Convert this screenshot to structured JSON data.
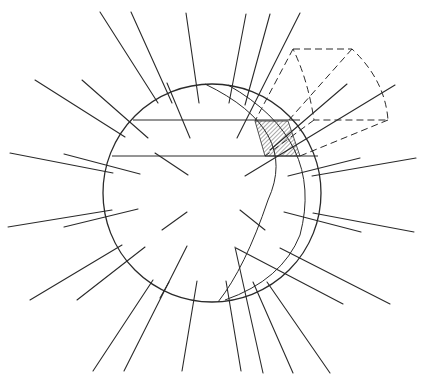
{
  "diagram": {
    "colors": {
      "stroke": "#2a2a2a",
      "background": "#ffffff",
      "hatch": "#555555"
    },
    "sphere": {
      "cx": 212,
      "cy": 193,
      "r": 109
    },
    "chords": [
      {
        "x1": 133,
        "y1": 120,
        "x2": 300,
        "y2": 120
      },
      {
        "x1": 112,
        "y1": 156,
        "x2": 318,
        "y2": 156
      }
    ],
    "arcs": [
      "M 205 84 Q 300 130 268 200 Q 245 268 218 302",
      "M 228 85 Q 325 140 300 235 Q 282 280 225 300"
    ],
    "hatched_patch": "M 255 121 L 288 121 L 300 156 L 265 156 Z",
    "dashed_frustum": {
      "outline": "M 293 49 L 352 49 Q 385 80 388 120 L 314 120 Q 308 80 293 49 Z",
      "projection_lines": [
        {
          "x1": 293,
          "y1": 49,
          "x2": 255,
          "y2": 121
        },
        {
          "x1": 352,
          "y1": 49,
          "x2": 288,
          "y2": 121
        },
        {
          "x1": 314,
          "y1": 120,
          "x2": 265,
          "y2": 156
        },
        {
          "x1": 388,
          "y1": 120,
          "x2": 300,
          "y2": 156
        }
      ]
    },
    "rays": [
      {
        "x1": 100,
        "y1": 12,
        "x2": 158,
        "y2": 103
      },
      {
        "x1": 131,
        "y1": 12,
        "x2": 172,
        "y2": 103
      },
      {
        "x1": 167,
        "y1": 83,
        "x2": 190,
        "y2": 138
      },
      {
        "x1": 186,
        "y1": 13,
        "x2": 199,
        "y2": 103
      },
      {
        "x1": 246,
        "y1": 14,
        "x2": 229,
        "y2": 103
      },
      {
        "x1": 300,
        "y1": 13,
        "x2": 237,
        "y2": 138
      },
      {
        "x1": 270,
        "y1": 14,
        "x2": 245,
        "y2": 105
      },
      {
        "x1": 35,
        "y1": 80,
        "x2": 125,
        "y2": 137
      },
      {
        "x1": 82,
        "y1": 80,
        "x2": 148,
        "y2": 138
      },
      {
        "x1": 10,
        "y1": 153,
        "x2": 113,
        "y2": 173
      },
      {
        "x1": 64,
        "y1": 154,
        "x2": 140,
        "y2": 174
      },
      {
        "x1": 155,
        "y1": 153,
        "x2": 188,
        "y2": 175
      },
      {
        "x1": 347,
        "y1": 84,
        "x2": 270,
        "y2": 150
      },
      {
        "x1": 395,
        "y1": 85,
        "x2": 245,
        "y2": 176
      },
      {
        "x1": 360,
        "y1": 158,
        "x2": 288,
        "y2": 176
      },
      {
        "x1": 416,
        "y1": 158,
        "x2": 312,
        "y2": 176
      },
      {
        "x1": 240,
        "y1": 210,
        "x2": 265,
        "y2": 230
      },
      {
        "x1": 8,
        "y1": 227,
        "x2": 112,
        "y2": 210
      },
      {
        "x1": 64,
        "y1": 227,
        "x2": 138,
        "y2": 209
      },
      {
        "x1": 162,
        "y1": 230,
        "x2": 187,
        "y2": 212
      },
      {
        "x1": 284,
        "y1": 212,
        "x2": 361,
        "y2": 232
      },
      {
        "x1": 313,
        "y1": 213,
        "x2": 414,
        "y2": 232
      },
      {
        "x1": 30,
        "y1": 300,
        "x2": 122,
        "y2": 245
      },
      {
        "x1": 77,
        "y1": 300,
        "x2": 145,
        "y2": 247
      },
      {
        "x1": 236,
        "y1": 248,
        "x2": 343,
        "y2": 304
      },
      {
        "x1": 280,
        "y1": 248,
        "x2": 390,
        "y2": 304
      },
      {
        "x1": 93,
        "y1": 371,
        "x2": 153,
        "y2": 280
      },
      {
        "x1": 124,
        "y1": 371,
        "x2": 187,
        "y2": 246
      },
      {
        "x1": 160,
        "y1": 298,
        "x2": 169,
        "y2": 282
      },
      {
        "x1": 182,
        "y1": 371,
        "x2": 197,
        "y2": 281
      },
      {
        "x1": 241,
        "y1": 371,
        "x2": 226,
        "y2": 281
      },
      {
        "x1": 263,
        "y1": 373,
        "x2": 235,
        "y2": 247
      },
      {
        "x1": 293,
        "y1": 373,
        "x2": 253,
        "y2": 282
      },
      {
        "x1": 330,
        "y1": 373,
        "x2": 267,
        "y2": 282
      }
    ]
  }
}
